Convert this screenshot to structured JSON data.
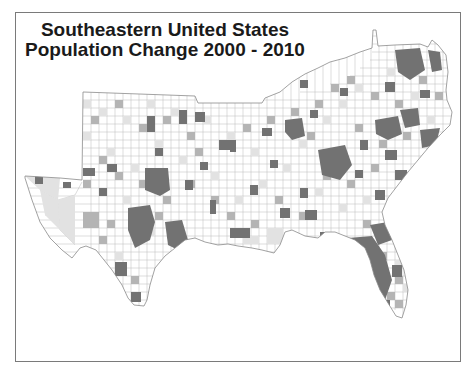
{
  "map": {
    "title_line1": "Southeastern United States",
    "title_line2": "Population Change 2000 - 2010",
    "region": "Southeastern United States",
    "units": "counties",
    "fill_classes": [
      {
        "name": "lowest",
        "color": "#ffffff"
      },
      {
        "name": "low",
        "color": "#e2e2e2"
      },
      {
        "name": "medium",
        "color": "#b4b4b4"
      },
      {
        "name": "high",
        "color": "#727272"
      }
    ],
    "border_color": "#9a9a9a",
    "frame_color": "#7a7a7a"
  }
}
